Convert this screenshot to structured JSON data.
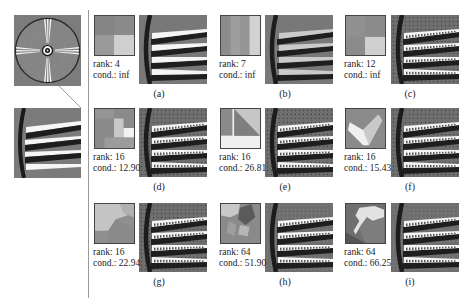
{
  "figure": {
    "overview": {
      "description": "Siemens star test chart with zoom region"
    },
    "panels": [
      {
        "label": "(a)",
        "rank_text": "rank: 4",
        "cond_text": "cond.: inf",
        "rank": 4,
        "cond": "inf"
      },
      {
        "label": "(b)",
        "rank_text": "rank: 7",
        "cond_text": "cond.: inf",
        "rank": 7,
        "cond": "inf"
      },
      {
        "label": "(c)",
        "rank_text": "rank: 12",
        "cond_text": "cond.: inf",
        "rank": 12,
        "cond": "inf"
      },
      {
        "label": "(d)",
        "rank_text": "rank: 16",
        "cond_text": "cond.: 12.90",
        "rank": 16,
        "cond": 12.9
      },
      {
        "label": "(e)",
        "rank_text": "rank: 16",
        "cond_text": "cond.: 26.81",
        "rank": 16,
        "cond": 26.81
      },
      {
        "label": "(f)",
        "rank_text": "rank: 16",
        "cond_text": "cond.: 15.43",
        "rank": 16,
        "cond": 15.43
      },
      {
        "label": "(g)",
        "rank_text": "rank: 16",
        "cond_text": "cond.: 22.94",
        "rank": 16,
        "cond": 22.94
      },
      {
        "label": "(h)",
        "rank_text": "rank: 64",
        "cond_text": "cond.: 51.90",
        "rank": 64,
        "cond": 51.9
      },
      {
        "label": "(i)",
        "rank_text": "rank: 64",
        "cond_text": "cond.: 66.25",
        "rank": 64,
        "cond": 66.25
      }
    ]
  }
}
